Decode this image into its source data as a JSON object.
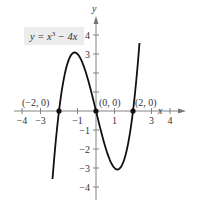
{
  "chart_data": {
    "type": "line",
    "title": "",
    "equation": {
      "prefix": "y = x",
      "exp": "3",
      "suffix": " − 4x"
    },
    "xlabel": "x",
    "ylabel": "y",
    "xlim": [
      -4.5,
      4.5
    ],
    "ylim": [
      -4.5,
      4.7
    ],
    "x_ticks": [
      -4,
      -3,
      -2,
      -1,
      1,
      2,
      3,
      4
    ],
    "x_tick_labels": [
      "−4",
      "−3",
      "",
      "−1",
      "1",
      "",
      "3",
      "4"
    ],
    "y_ticks": [
      -4,
      -3,
      -2,
      -1,
      1,
      2,
      3,
      4
    ],
    "y_tick_labels": [
      "−4",
      "−3",
      "−2",
      "−1",
      "",
      "",
      "3",
      "4"
    ],
    "grid": false,
    "series": [
      {
        "name": "y = x^3 - 4x",
        "function": "x^3 - 4x",
        "domain": [
          -2.35,
          2.35
        ],
        "color": "#111111"
      }
    ],
    "points": [
      {
        "x": -2,
        "y": 0,
        "label": "(−2, 0)"
      },
      {
        "x": 0,
        "y": 0,
        "label": "(0, 0)"
      },
      {
        "x": 2,
        "y": 0,
        "label": "(2, 0)"
      }
    ]
  }
}
